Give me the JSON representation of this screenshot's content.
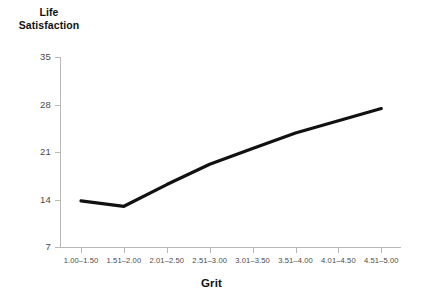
{
  "chart_data": {
    "type": "line",
    "title": "",
    "xlabel": "Grit",
    "ylabel": "Life Satisfaction",
    "ylabel_lines": [
      "Life",
      "Satisfaction"
    ],
    "categories": [
      "1.00–1.50",
      "1.51–2.00",
      "2.01–2.50",
      "2.51–3.00",
      "3.01–3.50",
      "3.51–4.00",
      "4.01–4.50",
      "4.51–5.00"
    ],
    "values": [
      13.8,
      13.0,
      16.2,
      19.2,
      21.5,
      23.8,
      25.6,
      27.4
    ],
    "series": [
      {
        "name": "Life Satisfaction",
        "values": [
          13.8,
          13.0,
          16.2,
          19.2,
          21.5,
          23.8,
          25.6,
          27.4
        ],
        "color": "#000000"
      }
    ],
    "yticks": [
      7,
      14,
      21,
      28,
      35
    ],
    "ytick_labels": [
      "7",
      "14",
      "21",
      "28",
      "35"
    ],
    "ylim": [
      7,
      35
    ],
    "xtick_labels": [
      "1.00–1.50",
      "1.51–2.00",
      "2.01–2.50",
      "2.51–3.00",
      "3.01–3.50",
      "3.51–4.00",
      "4.01–4.50",
      "4.51–5.00"
    ],
    "grid": false,
    "legend": false,
    "legend_position": "none",
    "line_color": "#111111",
    "axis_color": "#b8b8b8",
    "tick_label_color": "#4a4a4a",
    "background": "#ffffff"
  }
}
